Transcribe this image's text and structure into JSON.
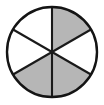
{
  "figure": {
    "name": "fraction-circle-diagram",
    "shape": "circle",
    "total_sectors": 6,
    "shaded_sectors": 3,
    "fraction_label": "3/6",
    "sector_angle_degrees": 60,
    "colors": {
      "shaded_fill": "#b6b6b6",
      "empty_fill": "#ffffff",
      "outline": "#141414",
      "divider": "#1a1a1a",
      "background": "#ffffff"
    },
    "geometry": {
      "center_x": 52,
      "center_y": 52,
      "radius": 45,
      "outline_width": 2.4,
      "divider_width": 2.1
    },
    "sectors": [
      {
        "id": "sector-top-right",
        "start_deg": -90,
        "end_deg": -30,
        "state": "shaded"
      },
      {
        "id": "sector-right",
        "start_deg": -30,
        "end_deg": 30,
        "state": "empty"
      },
      {
        "id": "sector-bottom-right",
        "start_deg": 30,
        "end_deg": 90,
        "state": "shaded"
      },
      {
        "id": "sector-bottom-left",
        "start_deg": 90,
        "end_deg": 150,
        "state": "shaded"
      },
      {
        "id": "sector-left",
        "start_deg": 150,
        "end_deg": 210,
        "state": "empty"
      },
      {
        "id": "sector-top-left",
        "start_deg": 210,
        "end_deg": 270,
        "state": "empty"
      }
    ],
    "dividers": [
      {
        "id": "divider-vertical",
        "x1": 52,
        "y1": 7,
        "x2": 52,
        "y2": 97
      },
      {
        "id": "divider-diagonal-down",
        "x1": 13.03,
        "y1": 29.5,
        "x2": 90.97,
        "y2": 74.5
      },
      {
        "id": "divider-diagonal-up",
        "x1": 13.03,
        "y1": 74.5,
        "x2": 90.97,
        "y2": 29.5
      }
    ]
  }
}
